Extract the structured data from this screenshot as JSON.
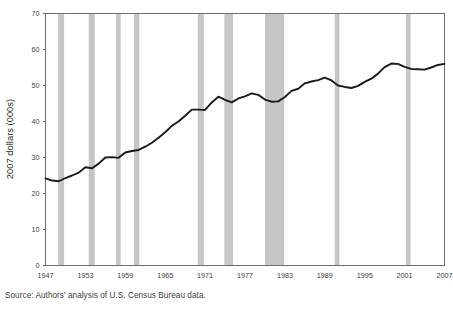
{
  "chart_data": {
    "type": "line",
    "title": "",
    "subtitle": "",
    "xlabel": "",
    "ylabel": "2007 dollars (000s)",
    "xlim": [
      1947,
      2007
    ],
    "ylim": [
      0,
      70
    ],
    "grid": false,
    "legend": "none",
    "x_ticks": [
      "1947",
      "1953",
      "1959",
      "1965",
      "1971",
      "1977",
      "1983",
      "1989",
      "1995",
      "2001",
      "2007"
    ],
    "y_ticks": [
      "0",
      "10",
      "20",
      "30",
      "40",
      "50",
      "60",
      "70"
    ],
    "series": [
      {
        "name": "Median household income",
        "x": [
          1947,
          1948,
          1949,
          1950,
          1951,
          1952,
          1953,
          1954,
          1955,
          1956,
          1957,
          1958,
          1959,
          1960,
          1961,
          1962,
          1963,
          1964,
          1965,
          1966,
          1967,
          1968,
          1969,
          1970,
          1971,
          1972,
          1973,
          1974,
          1975,
          1976,
          1977,
          1978,
          1979,
          1980,
          1981,
          1982,
          1983,
          1984,
          1985,
          1986,
          1987,
          1988,
          1989,
          1990,
          1991,
          1992,
          1993,
          1994,
          1995,
          1996,
          1997,
          1998,
          1999,
          2000,
          2001,
          2002,
          2003,
          2004,
          2005,
          2006,
          2007
        ],
        "y": [
          24.2,
          23.6,
          23.4,
          24.3,
          25.0,
          25.8,
          27.3,
          27.0,
          28.3,
          30.0,
          30.1,
          29.9,
          31.4,
          31.8,
          32.1,
          33.0,
          34.1,
          35.5,
          37.0,
          38.8,
          40.0,
          41.6,
          43.3,
          43.3,
          43.2,
          45.3,
          46.9,
          46.0,
          45.3,
          46.4,
          47.0,
          47.8,
          47.4,
          46.1,
          45.5,
          45.6,
          46.8,
          48.5,
          49.1,
          50.6,
          51.1,
          51.5,
          52.2,
          51.4,
          50.0,
          49.6,
          49.3,
          49.9,
          51.0,
          51.9,
          53.3,
          55.1,
          56.1,
          56.0,
          55.2,
          54.6,
          54.5,
          54.4,
          55.0,
          55.7,
          56.0
        ]
      }
    ],
    "recession_bands": [
      {
        "start": 1948.9,
        "end": 1949.8
      },
      {
        "start": 1953.5,
        "end": 1954.4
      },
      {
        "start": 1957.6,
        "end": 1958.3
      },
      {
        "start": 1960.3,
        "end": 1961.1
      },
      {
        "start": 1969.9,
        "end": 1970.8
      },
      {
        "start": 1973.9,
        "end": 1975.2
      },
      {
        "start": 1980.0,
        "end": 1982.9
      },
      {
        "start": 1990.5,
        "end": 1991.2
      },
      {
        "start": 2001.2,
        "end": 2001.9
      }
    ],
    "colors": {
      "line": "#1a1a1a",
      "recession_band": "#c6c6c6",
      "axis": "#6e6e6e",
      "text": "#231f20"
    }
  },
  "source_note": "Source: Authors' analysis of U.S. Census Bureau data."
}
